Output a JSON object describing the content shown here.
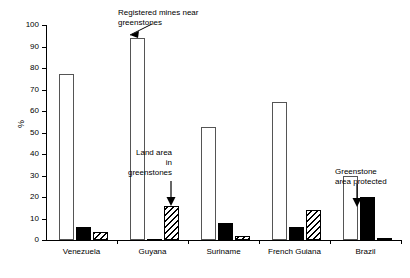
{
  "chart_data": {
    "type": "bar",
    "title": "",
    "subtitle": "",
    "xlabel": "",
    "ylabel": "%",
    "ylim": [
      0,
      100
    ],
    "ytick_step": 10,
    "yticks": [
      0,
      10,
      20,
      30,
      40,
      50,
      60,
      70,
      80,
      90,
      100
    ],
    "grid": false,
    "legend_position": "none",
    "categories": [
      "Venezuela",
      "Guyana",
      "Suriname",
      "French Guiana",
      "Brazil"
    ],
    "series": [
      {
        "name": "Registered mines near greenstones",
        "style": "white-outline",
        "values": [
          77,
          94,
          52.5,
          64,
          30
        ]
      },
      {
        "name": "Greenstone area protected",
        "style": "solid-black",
        "values": [
          6,
          0.5,
          8,
          6,
          20
        ]
      },
      {
        "name": "Land area in greenstones",
        "style": "hatched",
        "values": [
          3.5,
          16,
          2,
          14,
          0.5
        ]
      }
    ],
    "annotations": [
      {
        "text": "Registered mines near\ngreenstones",
        "target_series": "Registered mines near greenstones",
        "target_category": "Guyana"
      },
      {
        "text": "Land area\nin\ngreenstones",
        "target_series": "Land area in greenstones",
        "target_category": "Guyana"
      },
      {
        "text": "Greenstone\narea protected",
        "target_series": "Greenstone area protected",
        "target_category": "Brazil"
      }
    ]
  },
  "axis": {
    "y_title": "%",
    "tick_0": "0",
    "tick_10": "10",
    "tick_20": "20",
    "tick_30": "30",
    "tick_40": "40",
    "tick_50": "50",
    "tick_60": "60",
    "tick_70": "70",
    "tick_80": "80",
    "tick_90": "90",
    "tick_100": "100"
  },
  "annotations": {
    "mines": "Registered mines near\ngreenstones",
    "land_area": "Land area\nin\ngreenstones",
    "protected": "Greenstone\narea protected"
  },
  "categories": {
    "c0": "Venezuela",
    "c1": "Guyana",
    "c2": "Suriname",
    "c3": "French Guiana",
    "c4": "Brazil"
  }
}
